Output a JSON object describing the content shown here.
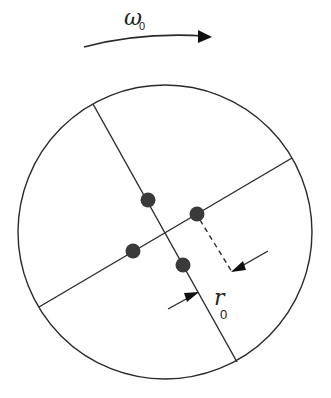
{
  "diagram": {
    "rotation_label": "ω",
    "rotation_subscript": "0",
    "radius_label": "r",
    "radius_subscript": "0",
    "colors": {
      "stroke": "#2a2a2a",
      "dot": "#3a3a3a",
      "background": "#ffffff"
    },
    "circle": {
      "cx": 165,
      "cy": 232,
      "r": 147
    },
    "dots": [
      {
        "cx": 148,
        "cy": 200
      },
      {
        "cx": 197,
        "cy": 214
      },
      {
        "cx": 133,
        "cy": 251
      },
      {
        "cx": 183,
        "cy": 265
      }
    ]
  }
}
